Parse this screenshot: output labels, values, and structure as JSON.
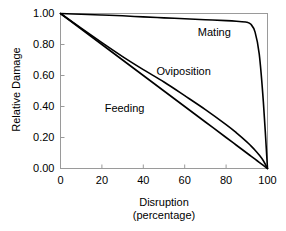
{
  "chart_data": {
    "type": "line",
    "title": "",
    "xlabel": "Disruption",
    "xlabel_line2": "(percentage)",
    "ylabel": "Relative Damage",
    "xlim": [
      0,
      100
    ],
    "ylim": [
      0,
      1.0
    ],
    "grid": false,
    "legend_position": "inline-annotations",
    "x_ticks": [
      0,
      20,
      40,
      60,
      80,
      100
    ],
    "x_tick_labels": [
      "0",
      "20",
      "40",
      "60",
      "80",
      "100"
    ],
    "y_ticks": [
      0.0,
      0.2,
      0.4,
      0.6,
      0.8,
      1.0
    ],
    "y_tick_labels": [
      "0.00",
      "0.20",
      "0.40",
      "0.60",
      "0.80",
      "1.00"
    ],
    "x": [
      0,
      10,
      20,
      30,
      40,
      50,
      60,
      70,
      80,
      85,
      90,
      92,
      94,
      96,
      98,
      100
    ],
    "series": [
      {
        "name": "Mating",
        "label": "Mating",
        "color": "#000000",
        "values": [
          1.0,
          0.995,
          0.99,
          0.985,
          0.978,
          0.972,
          0.966,
          0.96,
          0.954,
          0.95,
          0.944,
          0.93,
          0.88,
          0.74,
          0.43,
          0.0
        ]
      },
      {
        "name": "Oviposition",
        "label": "Oviposition",
        "color": "#000000",
        "values": [
          1.0,
          0.905,
          0.812,
          0.722,
          0.638,
          0.558,
          0.47,
          0.38,
          0.283,
          0.23,
          0.172,
          0.146,
          0.118,
          0.087,
          0.05,
          0.0
        ]
      },
      {
        "name": "Feeding",
        "label": "Feeding",
        "color": "#000000",
        "values": [
          1.0,
          0.9,
          0.8,
          0.7,
          0.6,
          0.5,
          0.4,
          0.3,
          0.2,
          0.15,
          0.1,
          0.08,
          0.06,
          0.04,
          0.02,
          0.0
        ]
      }
    ],
    "annotations": [
      {
        "text": "Mating",
        "x": 76,
        "y": 0.875
      },
      {
        "text": "Oviposition",
        "x": 56,
        "y": 0.625
      },
      {
        "text": "Feeding",
        "x": 31,
        "y": 0.385
      }
    ]
  },
  "colors": {
    "line": "#000000",
    "frame": "#9a9a9a",
    "axis": "#8c8c8c",
    "background": "#ffffff"
  }
}
